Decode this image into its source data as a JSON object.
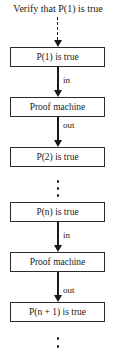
{
  "diagram": {
    "title": "Verify that P(1) is true",
    "boxes": [
      {
        "label": "P(1) is true"
      },
      {
        "label": "Proof machine"
      },
      {
        "label": "P(2) is true"
      },
      {
        "label": "P(n) is true"
      },
      {
        "label": "Proof machine"
      },
      {
        "label": "P(n + 1) is true"
      }
    ],
    "edges": [
      {
        "from": "title",
        "to": 0,
        "style": "dashed",
        "label": ""
      },
      {
        "from": 0,
        "to": 1,
        "style": "solid",
        "label": "in"
      },
      {
        "from": 1,
        "to": 2,
        "style": "solid",
        "label": "out"
      },
      {
        "from": 2,
        "to": 3,
        "style": "ellipsis",
        "label": ""
      },
      {
        "from": 3,
        "to": 4,
        "style": "solid",
        "label": "in"
      },
      {
        "from": 4,
        "to": 5,
        "style": "solid",
        "label": "out"
      },
      {
        "from": 5,
        "to": "continuation",
        "style": "ellipsis",
        "label": ""
      }
    ],
    "colors": {
      "stroke": "#1a1a1a",
      "background": "#ffffff"
    }
  }
}
